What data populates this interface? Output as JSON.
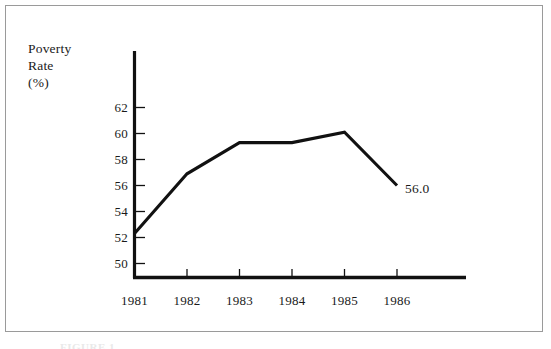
{
  "figure": {
    "background_color": "#ffffff",
    "frame_color": "#9a9a9a",
    "line_color": "#111111",
    "caption_partial": "FIGURE 1."
  },
  "chart_data": {
    "type": "line",
    "title": "",
    "subtitle": "",
    "xlabel": "",
    "ylabel": "Poverty Rate (%)",
    "ylabel_lines": [
      "Poverty",
      "Rate",
      "(%)"
    ],
    "categories": [
      "1981",
      "1982",
      "1983",
      "1984",
      "1985",
      "1986"
    ],
    "x": [
      1981,
      1982,
      1983,
      1984,
      1985,
      1986
    ],
    "values": [
      52.3,
      56.9,
      59.3,
      59.3,
      60.1,
      56.0
    ],
    "series": [
      {
        "name": "Poverty Rate",
        "values": [
          52.3,
          56.9,
          59.3,
          59.3,
          60.1,
          56.0
        ]
      }
    ],
    "ylim": [
      49.2,
      63.6
    ],
    "xlim": [
      1980.7,
      1987.3
    ],
    "yticks": [
      50,
      52,
      54,
      56,
      58,
      60,
      62
    ],
    "ytick_labels": [
      "50",
      "52",
      "54",
      "56",
      "58",
      "60",
      "62"
    ],
    "xtick_labels": [
      "1981",
      "1982",
      "1983",
      "1984",
      "1985",
      "1986"
    ],
    "grid": false,
    "legend": false,
    "legend_position": "none",
    "annotations": [
      {
        "text": "56.0",
        "x": 1986,
        "y": 56.0,
        "position": "right-of-point"
      }
    ]
  },
  "axis_labels": {
    "y_line_1": "Poverty",
    "y_line_2": "Rate",
    "y_line_3": "(%)"
  },
  "yticks": [
    {
      "label": "62"
    },
    {
      "label": "60"
    },
    {
      "label": "58"
    },
    {
      "label": "56"
    },
    {
      "label": "54"
    },
    {
      "label": "52"
    },
    {
      "label": "50"
    }
  ],
  "xticks": [
    {
      "label": "1981"
    },
    {
      "label": "1982"
    },
    {
      "label": "1983"
    },
    {
      "label": "1984"
    },
    {
      "label": "1985"
    },
    {
      "label": "1986"
    }
  ],
  "annotation": {
    "end_value": "56.0"
  }
}
